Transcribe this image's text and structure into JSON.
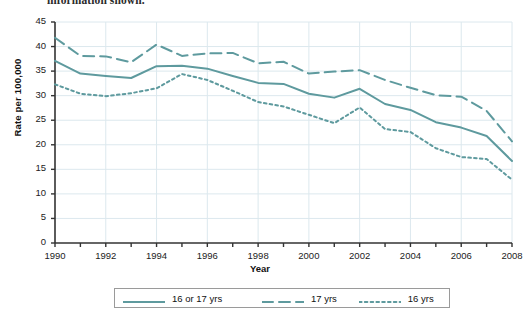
{
  "page": {
    "clipped_caption": "information shown."
  },
  "chart_data": {
    "type": "line",
    "title": "",
    "xlabel": "Year",
    "ylabel": "Rate per 100,000",
    "xlim": [
      1990,
      2008
    ],
    "ylim": [
      0,
      45
    ],
    "grid": true,
    "legend_position": "bottom",
    "x": [
      1990,
      1991,
      1992,
      1993,
      1994,
      1995,
      1996,
      1997,
      1998,
      1999,
      2000,
      2001,
      2002,
      2003,
      2004,
      2005,
      2006,
      2007,
      2008
    ],
    "xticks": [
      1990,
      1992,
      1994,
      1996,
      1998,
      2000,
      2002,
      2004,
      2006,
      2008
    ],
    "yticks": [
      0,
      5,
      10,
      15,
      20,
      25,
      30,
      35,
      40,
      45
    ],
    "series": [
      {
        "name": "16 or 17 yrs",
        "style": "solid",
        "color": "#5e9a9e",
        "values": [
          37.1,
          34.5,
          34.0,
          33.6,
          36.0,
          36.1,
          35.5,
          34.0,
          32.6,
          32.4,
          30.4,
          29.6,
          31.4,
          28.3,
          27.1,
          24.6,
          23.5,
          21.8,
          16.7
        ]
      },
      {
        "name": "17 yrs",
        "style": "dashed",
        "color": "#5e9a9e",
        "values": [
          41.8,
          38.1,
          38.0,
          36.8,
          40.4,
          38.1,
          38.6,
          38.7,
          36.6,
          36.9,
          34.5,
          34.9,
          35.2,
          33.2,
          31.6,
          30.1,
          29.8,
          26.9,
          20.7
        ]
      },
      {
        "name": "16 yrs",
        "style": "dotted",
        "color": "#5e9a9e",
        "values": [
          32.3,
          30.4,
          29.9,
          30.5,
          31.5,
          34.4,
          33.2,
          31.0,
          28.7,
          27.8,
          26.1,
          24.4,
          27.6,
          23.2,
          22.6,
          19.3,
          17.5,
          17.1,
          12.9
        ]
      }
    ]
  },
  "legend": {
    "items": [
      {
        "label": "16 or 17 yrs",
        "style": "solid"
      },
      {
        "label": "17 yrs",
        "style": "dashed"
      },
      {
        "label": "16 yrs",
        "style": "dotted"
      }
    ]
  },
  "colors": {
    "line": "#5e9a9e",
    "grid": "#dce8ee",
    "axis": "#333333",
    "legend_border": "#9a9a9a"
  }
}
